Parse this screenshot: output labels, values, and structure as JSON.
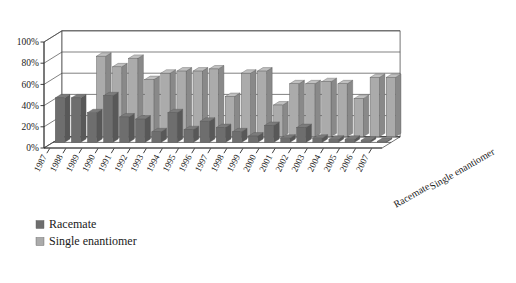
{
  "chart_data": {
    "type": "bar",
    "title": "",
    "subtitle": "",
    "xlabel": "",
    "ylabel": "",
    "zlabel": "",
    "ylim": [
      0,
      100
    ],
    "ytick_labels": [
      "0%",
      "20%",
      "40%",
      "60%",
      "80%",
      "100%"
    ],
    "ytick_values": [
      0,
      20,
      40,
      60,
      80,
      100
    ],
    "grid": true,
    "legend_position": "bottom-left",
    "categories": [
      "1987",
      "1988",
      "1989",
      "1990",
      "1991",
      "1992",
      "1993",
      "1994",
      "1995",
      "1996",
      "1997",
      "1998",
      "1999",
      "2000",
      "2001",
      "2002",
      "2003",
      "2004",
      "2005",
      "2006",
      "2007"
    ],
    "depth_categories": [
      "Racemate",
      "Single enantiomer"
    ],
    "series": [
      {
        "name": "Racemate",
        "color": "#6e6e6e",
        "values": [
          42,
          42,
          28,
          44,
          24,
          22,
          10,
          28,
          12,
          20,
          14,
          10,
          6,
          16,
          4,
          14,
          4,
          3,
          3,
          2,
          1
        ]
      },
      {
        "name": "Single enantiomer",
        "color": "#ababab",
        "values": [
          0,
          0,
          76,
          66,
          74,
          54,
          60,
          62,
          62,
          64,
          38,
          60,
          62,
          30,
          50,
          50,
          52,
          50,
          36,
          56,
          56
        ]
      }
    ]
  },
  "legend": {
    "items": [
      {
        "label": "Racemate",
        "color": "#6e6e6e"
      },
      {
        "label": "Single enantiomer",
        "color": "#ababab"
      }
    ]
  },
  "depth_axis": {
    "front_label": "Racemate",
    "back_label": "Single enantiomer"
  }
}
